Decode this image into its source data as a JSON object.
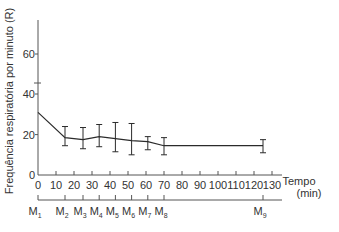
{
  "chart_data": {
    "type": "line",
    "title": "",
    "xlabel": "Tempo (min)",
    "xlabel_line1": "Tempo",
    "xlabel_line2": "(min)",
    "ylabel": "Frequência respiratória por minuto (R)",
    "xlim": [
      0,
      130
    ],
    "ylim": [
      0,
      70
    ],
    "x_ticks": [
      0,
      10,
      20,
      30,
      40,
      50,
      60,
      70,
      80,
      90,
      100,
      110,
      120,
      130
    ],
    "y_ticks": [
      0,
      20,
      40,
      60
    ],
    "y_axis_break": true,
    "grid": false,
    "legend": null,
    "series": [
      {
        "name": "Frequência respiratória",
        "points": [
          {
            "moment": "M1",
            "x": 0,
            "y": 31,
            "err_low": null,
            "err_high": null
          },
          {
            "moment": "M2",
            "x": 15,
            "y": 18.5,
            "err_low": 14.5,
            "err_high": 24
          },
          {
            "moment": "M3",
            "x": 25,
            "y": 17.5,
            "err_low": 13,
            "err_high": 23.5
          },
          {
            "moment": "M4",
            "x": 34,
            "y": 19,
            "err_low": 14,
            "err_high": 25
          },
          {
            "moment": "M5",
            "x": 43,
            "y": 18,
            "err_low": 11.5,
            "err_high": 26
          },
          {
            "moment": "M6",
            "x": 52,
            "y": 17,
            "err_low": 10,
            "err_high": 25.5
          },
          {
            "moment": "M7",
            "x": 61,
            "y": 16.5,
            "err_low": 12.5,
            "err_high": 19
          },
          {
            "moment": "M8",
            "x": 70,
            "y": 14.5,
            "err_low": 10,
            "err_high": 18.5
          },
          {
            "moment": "M9",
            "x": 125,
            "y": 14.5,
            "err_low": 11,
            "err_high": 17.5
          }
        ]
      }
    ],
    "moments": [
      {
        "label": "M",
        "sub": "1",
        "x": 0
      },
      {
        "label": "M",
        "sub": "2",
        "x": 15
      },
      {
        "label": "M",
        "sub": "3",
        "x": 25
      },
      {
        "label": "M",
        "sub": "4",
        "x": 34
      },
      {
        "label": "M",
        "sub": "5",
        "x": 43
      },
      {
        "label": "M",
        "sub": "6",
        "x": 52
      },
      {
        "label": "M",
        "sub": "7",
        "x": 61
      },
      {
        "label": "M",
        "sub": "8",
        "x": 70
      },
      {
        "label": "M",
        "sub": "9",
        "x": 125
      }
    ]
  },
  "colors": {
    "line": "#2b2b2b",
    "axis": "#555555",
    "text": "#333333"
  }
}
